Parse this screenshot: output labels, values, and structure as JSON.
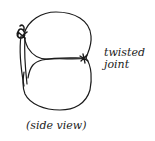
{
  "figure": {
    "joint_label_line1": "twisted",
    "joint_label_line2": "joint",
    "caption": "(side view)",
    "stroke_color": "#1a1a1a",
    "background": "#ffffff"
  },
  "elements": [
    {
      "name": "top-loop",
      "description": "upper rounded loop of wire"
    },
    {
      "name": "bottom-loop",
      "description": "lower rounded loop of wire"
    },
    {
      "name": "middle-strand",
      "description": "wire from left side to right twisted joint"
    },
    {
      "name": "left-knot",
      "description": "twisted knot at upper left"
    },
    {
      "name": "right-twisted-joint",
      "description": "twisted joint on right side"
    }
  ]
}
